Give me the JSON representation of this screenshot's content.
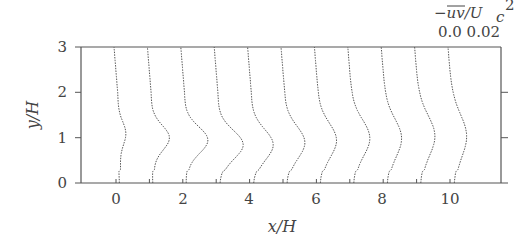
{
  "chart_data": {
    "type": "line",
    "title": "",
    "xlabel": "x/H",
    "ylabel": "y/H",
    "xlim": [
      -1,
      11.6
    ],
    "ylim": [
      0,
      3
    ],
    "x_ticks": [
      "0",
      "2",
      "4",
      "6",
      "8",
      "10"
    ],
    "x_tick_values": [
      0,
      2,
      4,
      6,
      8,
      10
    ],
    "y_ticks": [
      "0",
      "1",
      "2",
      "3"
    ],
    "y_tick_values": [
      0,
      1,
      2,
      3
    ],
    "grid": false,
    "legend": null,
    "scale_annotation": {
      "quantity": "-uv/Uc^2",
      "label_line1": "−uv/U",
      "subscript": "c",
      "superscript": "2",
      "range_labels": "0.0 0.02",
      "scale_min": 0.0,
      "scale_max": 0.02
    },
    "profile_note": "Vertical profiles of Reynolds shear stress -uv/Uc^2 plotted at each station x/H; each profile offset to its station; peak near y/H ≈ 1",
    "series": [
      {
        "name": "x/H=0",
        "station": 0,
        "peak_y": 1.1,
        "peak_value": 0.004
      },
      {
        "name": "x/H=1",
        "station": 1,
        "peak_y": 1.0,
        "peak_value": 0.01
      },
      {
        "name": "x/H=2",
        "station": 2,
        "peak_y": 0.95,
        "peak_value": 0.013
      },
      {
        "name": "x/H=3",
        "station": 3,
        "peak_y": 0.85,
        "peak_value": 0.014
      },
      {
        "name": "x/H=4",
        "station": 4,
        "peak_y": 0.85,
        "peak_value": 0.012
      },
      {
        "name": "x/H=5",
        "station": 5,
        "peak_y": 0.9,
        "peak_value": 0.011
      },
      {
        "name": "x/H=6",
        "station": 6,
        "peak_y": 0.95,
        "peak_value": 0.01
      },
      {
        "name": "x/H=7",
        "station": 7,
        "peak_y": 1.0,
        "peak_value": 0.01
      },
      {
        "name": "x/H=8",
        "station": 8,
        "peak_y": 1.0,
        "peak_value": 0.009
      },
      {
        "name": "x/H=9",
        "station": 9,
        "peak_y": 1.05,
        "peak_value": 0.009
      },
      {
        "name": "x/H=10",
        "station": 10,
        "peak_y": 1.05,
        "peak_value": 0.008
      }
    ]
  }
}
